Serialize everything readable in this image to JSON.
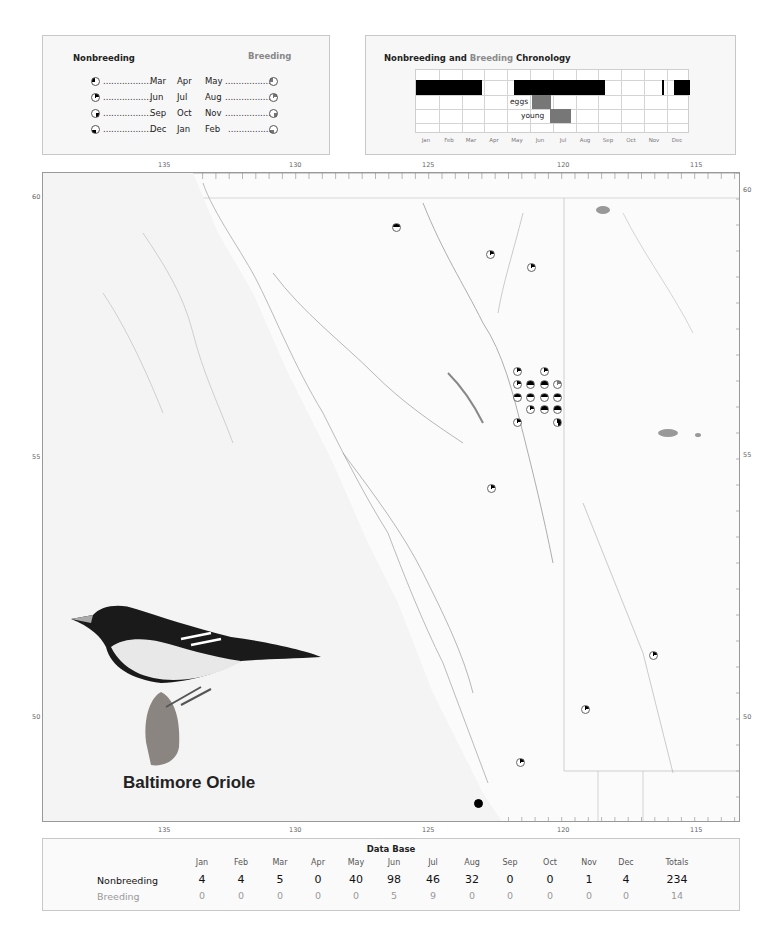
{
  "legend": {
    "nonbreeding_title": "Nonbreeding",
    "breeding_title": "Breeding",
    "rows": [
      {
        "left_month": "Mar",
        "mid_month": "Apr",
        "right_month": "May",
        "quarter": "top-left"
      },
      {
        "left_month": "Jun",
        "mid_month": "Jul",
        "right_month": "Aug",
        "quarter": "top-right"
      },
      {
        "left_month": "Sep",
        "mid_month": "Oct",
        "right_month": "Nov",
        "quarter": "bottom-right"
      },
      {
        "left_month": "Dec",
        "mid_month": "Jan",
        "right_month": "Feb",
        "quarter": "bottom-left"
      }
    ],
    "dots": "..................",
    "colors": {
      "nonbreeding": "#000000",
      "breeding": "#777777"
    }
  },
  "chronology": {
    "title_part1": "Nonbreeding and ",
    "title_part2": "Breeding",
    "title_part3": " Chronology",
    "months": [
      "Jan",
      "Feb",
      "Mar",
      "Apr",
      "May",
      "Jun",
      "Jul",
      "Aug",
      "Sep",
      "Oct",
      "Nov",
      "Dec"
    ],
    "eggs_label": "eggs",
    "young_label": "young"
  },
  "map": {
    "top_axis": [
      "135",
      "130",
      "125",
      "120",
      "115"
    ],
    "bottom_axis": [
      "135",
      "130",
      "125",
      "120",
      "115"
    ],
    "lat_left": [
      "60",
      "55",
      "50"
    ],
    "lat_right": [
      "60",
      "55",
      "50"
    ]
  },
  "species": {
    "name": "Baltimore Oriole"
  },
  "database": {
    "title": "Data Base",
    "months": [
      "Jan",
      "Feb",
      "Mar",
      "Apr",
      "May",
      "Jun",
      "Jul",
      "Aug",
      "Sep",
      "Oct",
      "Nov",
      "Dec"
    ],
    "totals_label": "Totals",
    "nonbreeding_label": "Nonbreeding",
    "breeding_label": "Breeding",
    "nonbreeding": [
      "4",
      "4",
      "5",
      "0",
      "40",
      "98",
      "46",
      "32",
      "0",
      "0",
      "1",
      "4"
    ],
    "nonbreeding_total": "234",
    "breeding": [
      "0",
      "0",
      "0",
      "0",
      "0",
      "5",
      "9",
      "0",
      "0",
      "0",
      "0",
      "0"
    ],
    "breeding_total": "14"
  },
  "chart_data": [
    {
      "type": "table",
      "title": "Data Base",
      "categories": [
        "Jan",
        "Feb",
        "Mar",
        "Apr",
        "May",
        "Jun",
        "Jul",
        "Aug",
        "Sep",
        "Oct",
        "Nov",
        "Dec"
      ],
      "series": [
        {
          "name": "Nonbreeding",
          "values": [
            4,
            4,
            5,
            0,
            40,
            98,
            46,
            32,
            0,
            0,
            1,
            4
          ],
          "total": 234
        },
        {
          "name": "Breeding",
          "values": [
            0,
            0,
            0,
            0,
            0,
            5,
            9,
            0,
            0,
            0,
            0,
            0
          ],
          "total": 14
        }
      ]
    },
    {
      "type": "bar",
      "title": "Nonbreeding and Breeding Chronology",
      "categories": [
        "Jan",
        "Feb",
        "Mar",
        "Apr",
        "May",
        "Jun",
        "Jul",
        "Aug",
        "Sep",
        "Oct",
        "Nov",
        "Dec"
      ],
      "series": [
        {
          "name": "Nonbreeding occurrence",
          "ranges": [
            [
              "Jan 1",
              "Mar 31"
            ],
            [
              "May 15",
              "Aug 31"
            ],
            [
              "Nov 25",
              "Nov 27"
            ],
            [
              "Dec 10",
              "Dec 31"
            ]
          ]
        },
        {
          "name": "eggs",
          "ranges": [
            [
              "Jun 1",
              "Jun 30"
            ]
          ]
        },
        {
          "name": "young",
          "ranges": [
            [
              "Jun 25",
              "Jul 20"
            ]
          ]
        }
      ]
    }
  ]
}
